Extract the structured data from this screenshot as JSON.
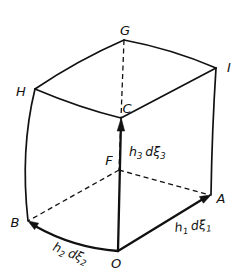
{
  "figure": {
    "vertices": {
      "G": "G",
      "I": "I",
      "H": "H",
      "C": "C",
      "F": "F",
      "A": "A",
      "B": "B",
      "O": "O"
    },
    "vectors": {
      "v1": {
        "scale": "h",
        "scale_index": "1",
        "diff": "dξ",
        "diff_index": "1",
        "from": "O",
        "to": "A"
      },
      "v2": {
        "scale": "h",
        "scale_index": "2",
        "diff": "dξ",
        "diff_index": "2",
        "from": "O",
        "to": "B"
      },
      "v3": {
        "scale": "h",
        "scale_index": "3",
        "diff": "dξ",
        "diff_index": "3",
        "from": "O",
        "to": "C"
      }
    },
    "colors": {
      "line": "#111111",
      "background": "#ffffff"
    }
  }
}
